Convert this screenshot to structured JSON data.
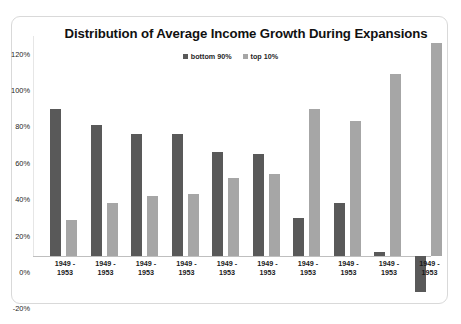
{
  "chart_data": {
    "type": "bar",
    "title": "Distribution of Average Income Growth During Expansions",
    "xlabel": "",
    "ylabel": "",
    "ylim": [
      -20,
      120
    ],
    "ytick_step": 20,
    "ytick_labels": [
      "120%",
      "100%",
      "80%",
      "60%",
      "40%",
      "20%",
      "0%",
      "-20%"
    ],
    "ytick_values": [
      120,
      100,
      80,
      60,
      40,
      20,
      0,
      -20
    ],
    "grid": false,
    "legend_position": "top-center",
    "categories": [
      "1949 -\n1953",
      "1949 -\n1953",
      "1949 -\n1953",
      "1949 -\n1953",
      "1949 -\n1953",
      "1949 -\n1953",
      "1949 -\n1953",
      "1949 -\n1953",
      "1949 -\n1953",
      "1949 -\n1953"
    ],
    "series": [
      {
        "name": "bottom 90%",
        "color": "#595959",
        "values": [
          81,
          72,
          67,
          67,
          57,
          56,
          21,
          29,
          2,
          -20
        ]
      },
      {
        "name": "top 10%",
        "color": "#a6a6a6",
        "values": [
          20,
          29,
          33,
          34,
          43,
          45,
          81,
          74,
          100,
          117
        ]
      }
    ]
  },
  "caption": ""
}
